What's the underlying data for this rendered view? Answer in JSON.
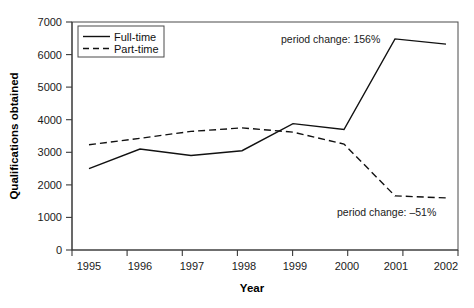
{
  "chart_data": {
    "type": "line",
    "title": "",
    "xlabel": "Year",
    "ylabel": "Qualifications obtained",
    "categories": [
      "1995",
      "1996",
      "1997",
      "1998",
      "1999",
      "2000",
      "2001",
      "2002"
    ],
    "x": [
      1995,
      1996,
      1997,
      1998,
      1999,
      2000,
      2001,
      2002
    ],
    "xlim": [
      1995,
      2002
    ],
    "ylim": [
      0,
      7000
    ],
    "yticks": [
      "0",
      "1000",
      "2000",
      "3000",
      "4000",
      "5000",
      "6000",
      "7000"
    ],
    "ytick_values": [
      0,
      1000,
      2000,
      3000,
      4000,
      5000,
      6000,
      7000
    ],
    "grid": false,
    "legend_position": "top-left inside plot",
    "series": [
      {
        "name": "Full-time",
        "style": "solid",
        "color": "#111111",
        "values": [
          2500,
          3100,
          2900,
          3050,
          3880,
          3700,
          6480,
          6320
        ]
      },
      {
        "name": "Part-time",
        "style": "dashed",
        "color": "#111111",
        "values": [
          3230,
          3430,
          3640,
          3750,
          3620,
          3250,
          1660,
          1600
        ]
      }
    ],
    "annotations": [
      {
        "text": "period change: 156%",
        "series": "Full-time"
      },
      {
        "text": "period change: –51%",
        "series": "Part-time"
      }
    ]
  },
  "legend": {
    "items": [
      {
        "label": "Full-time"
      },
      {
        "label": "Part-time"
      }
    ]
  }
}
